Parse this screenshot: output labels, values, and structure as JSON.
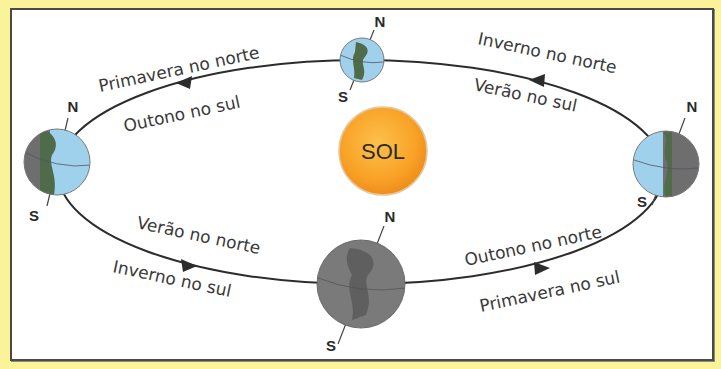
{
  "diagram": {
    "sun": {
      "label": "SOL",
      "color": "#f9a72a"
    },
    "colors": {
      "background": "#fbf39a",
      "panel": "#ffffff",
      "border": "#4a4a44",
      "ocean": "#9fd0ec",
      "land": "#4f6b4a",
      "night": "#6e6e6e",
      "orbit": "#2c2c2c"
    },
    "poles": {
      "north": "N",
      "south": "S"
    },
    "labels": {
      "top_left_north": "Primavera no norte",
      "top_left_south": "Outono no sul",
      "top_right_north": "Inverno no norte",
      "top_right_south": "Verão no sul",
      "bottom_left_north": "Verão no norte",
      "bottom_left_south": "Inverno no sul",
      "bottom_right_north": "Outono no norte",
      "bottom_right_south": "Primavera no sul"
    },
    "earths": [
      {
        "position": "left",
        "north_label": "N",
        "south_label": "S"
      },
      {
        "position": "top",
        "north_label": "N",
        "south_label": "S"
      },
      {
        "position": "right",
        "north_label": "N",
        "south_label": "S"
      },
      {
        "position": "bottom",
        "north_label": "N",
        "south_label": "S"
      }
    ]
  }
}
